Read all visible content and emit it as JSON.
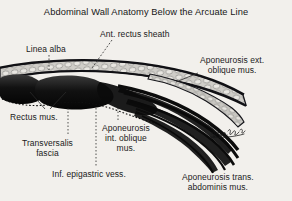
{
  "figure": {
    "title": "Abdominal Wall Anatomy Below the Arcuate Line",
    "background_color": "#f2f0ec",
    "ink_color": "#1b1b1b",
    "type": "anatomical-cross-section-illustration",
    "signature": "artist-signature"
  },
  "labels": {
    "linea_alba": "Linea alba",
    "ant_rectus_sheath": "Ant. rectus sheath",
    "aponeurosis_ext_oblique": "Aponeurosis ext.\noblique mus.",
    "rectus_mus": "Rectus mus.",
    "transversalis_fascia": "Transversalis\nfascia",
    "aponeurosis_int_oblique": "Aponeurosis\nint. oblique\nmus.",
    "inf_epigastric_vess": "Inf. epigastric vess.",
    "aponeurosis_trans_abdominis": "Aponeurosis trans.\nabdominis mus."
  }
}
